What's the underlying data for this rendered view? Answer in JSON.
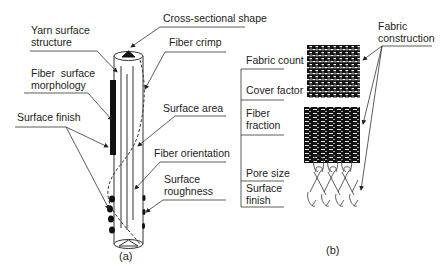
{
  "panel_a": {
    "caption": "(a)",
    "labels": {
      "cross_sectional_shape": "Cross-sectional shape",
      "yarn_surface_structure": "Yarn surface\nstructure",
      "fiber_surface_morphology": "Fiber  surface\nmorphology",
      "surface_finish": "Surface finish",
      "fiber_crimp": "Fiber crimp",
      "surface_area": "Surface area",
      "fiber_orientation": "Fiber orientation",
      "surface_roughness": "Surface\nroughness"
    }
  },
  "panel_b": {
    "caption": "(b)",
    "labels": {
      "fabric_construction": "Fabric\nconstruction",
      "fabric_count": "Fabric count",
      "cover_factor": "Cover factor",
      "fiber_fraction": "Fiber\nfraction",
      "pore_size": "Pore size",
      "surface_finish": "Surface\nfinish"
    },
    "fabric_images": [
      "plain-weave",
      "twill-weave",
      "knit-structure"
    ]
  },
  "colors": {
    "line": "#333333",
    "fill_dark": "#111111",
    "background": "#ffffff"
  }
}
